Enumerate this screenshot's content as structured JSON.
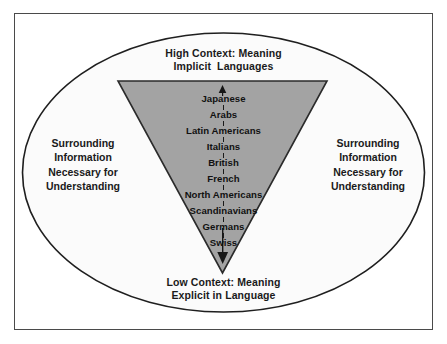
{
  "diagram": {
    "title_top": "High Context: Meaning\nImplicit  Languages",
    "title_bottom": "Low Context: Meaning\nExplicit in Language",
    "side_left_text": "Surrounding\nInformation\nNecessary for\nUnderstanding",
    "side_right_text": "Surrounding\nInformation\nNecessary for\nUnderstanding",
    "cultures": [
      "Japanese",
      "Arabs",
      "Latin Americans",
      "Italians",
      "British",
      "French",
      "North Americans",
      "Scandinavians",
      "Germans",
      "Swiss"
    ],
    "colors": {
      "frame_border": "#4a4a4a",
      "ellipse_fill": "#fbfbfb",
      "ellipse_stroke": "#1f1f1f",
      "triangle_fill": "#a3a3a3",
      "triangle_stroke": "#2b2b2b",
      "text": "#1a1a1a",
      "background": "#ffffff"
    },
    "icons": {
      "up_arrow": "up-arrow-icon",
      "down_arrow": "down-arrow-icon"
    }
  }
}
